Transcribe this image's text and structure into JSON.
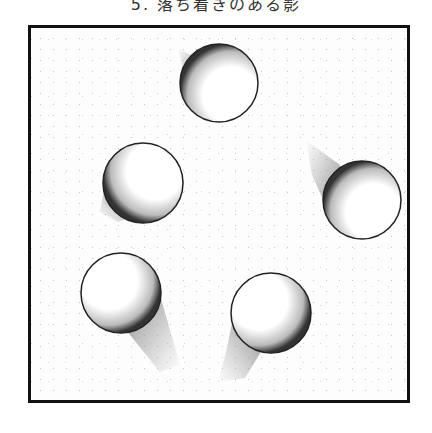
{
  "caption": "5. 落ち着きのある影",
  "figure": {
    "frame": {
      "x": 28,
      "y": 25,
      "width": 382,
      "height": 378,
      "border_color": "#111111"
    },
    "background_color": "#fdfdfd",
    "spheres": [
      {
        "name": "top",
        "cx": 219,
        "cy": 83,
        "r": 39,
        "shadow_dir": "up-left",
        "shadow_length": "short"
      },
      {
        "name": "left",
        "cx": 143,
        "cy": 183,
        "r": 40,
        "shadow_dir": "down-left",
        "shadow_length": "short"
      },
      {
        "name": "right",
        "cx": 362,
        "cy": 200,
        "r": 39,
        "shadow_dir": "up-left",
        "shadow_length": "long"
      },
      {
        "name": "bottom-left",
        "cx": 121,
        "cy": 293,
        "r": 40,
        "shadow_dir": "down-right",
        "shadow_length": "long"
      },
      {
        "name": "bottom-right",
        "cx": 271,
        "cy": 313,
        "r": 40,
        "shadow_dir": "down-left",
        "shadow_length": "long"
      }
    ]
  }
}
